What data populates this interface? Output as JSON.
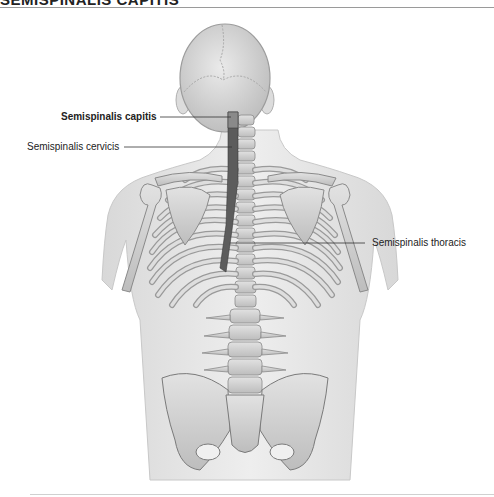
{
  "header": {
    "title": "SEMISPINALIS CAPITIS"
  },
  "figure": {
    "colors": {
      "skin": "#e6e6e6",
      "bone": "#d2d2d2",
      "bone_outline": "#8a8a8a",
      "muscle": "#5a5a5a",
      "leader_line": "#333333"
    },
    "labels": [
      {
        "text": "Semispinalis capitis",
        "bold": true
      },
      {
        "text": "Semispinalis cervicis",
        "bold": false
      },
      {
        "text": "Semispinalis thoracis",
        "bold": false
      }
    ]
  }
}
